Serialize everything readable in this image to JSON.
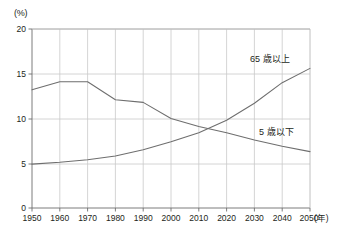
{
  "chart_data": {
    "type": "line",
    "title": "",
    "subtitle": "",
    "xlabel": "(年)",
    "ylabel": "(%)",
    "unit_label_y": "(%)",
    "unit_label_x": "(年)",
    "grid": true,
    "legend_position": "inline-annotation",
    "xlim": [
      1950,
      2050
    ],
    "ylim": [
      0,
      20
    ],
    "x_ticks": [
      1950,
      1960,
      1970,
      1980,
      1990,
      2000,
      2010,
      2020,
      2030,
      2040,
      2050
    ],
    "x_tick_labels": [
      "1950",
      "1960",
      "1970",
      "1980",
      "1990",
      "2000",
      "2010",
      "2020",
      "2030",
      "2040",
      "2050"
    ],
    "y_ticks": [
      0,
      5,
      10,
      15,
      20
    ],
    "y_tick_labels": [
      "0",
      "5",
      "10",
      "15",
      "20"
    ],
    "x": [
      1950,
      1960,
      1970,
      1980,
      1990,
      2000,
      2010,
      2020,
      2030,
      2040,
      2050
    ],
    "series": [
      {
        "name": "65 歳以上",
        "label": "65 歳以上",
        "color": "#6e6e6e",
        "values": [
          4.9,
          5.1,
          5.4,
          5.8,
          6.5,
          7.4,
          8.4,
          9.8,
          11.7,
          14.0,
          15.6
        ]
      },
      {
        "name": "5 歳以下",
        "label": "5 歳以下",
        "color": "#6e6e6e",
        "values": [
          13.2,
          14.1,
          14.1,
          12.1,
          11.8,
          10.0,
          9.1,
          8.4,
          7.6,
          6.9,
          6.3
        ]
      }
    ],
    "annotations": [
      {
        "text": "65 歳以上",
        "x": 2035,
        "y": 16.6
      },
      {
        "text": "5 歳以下",
        "x": 2036,
        "y": 8.6
      }
    ]
  },
  "axis": {
    "y_unit": "(%)",
    "x_unit": "(年)"
  }
}
